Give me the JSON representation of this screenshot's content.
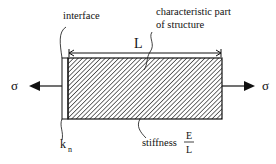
{
  "diagram": {
    "labels": {
      "interface": "interface",
      "characteristic_line1": "characteristic part",
      "characteristic_line2": "of structure",
      "length": "L",
      "stress_left": "σ",
      "stress_right": "σ",
      "interface_stiffness_k": "k",
      "interface_stiffness_sub": "n",
      "stiffness_text": "stiffness",
      "stiffness_numerator": "E",
      "stiffness_denominator": "L"
    },
    "colors": {
      "stroke": "#111111",
      "hatch": "#222222",
      "background": "#ffffff"
    }
  }
}
